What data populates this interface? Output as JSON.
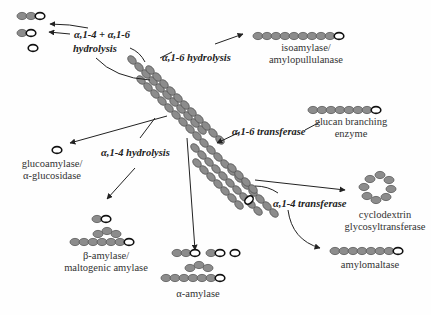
{
  "colors": {
    "glucose_fill": "#8c8c8c",
    "glucose_stroke": "#555555",
    "reducing_end_stroke": "#111111",
    "line": "#222222",
    "background": "#fefefe"
  },
  "reactions": {
    "a14_a16_hydrolysis_line1": "α,1-4 + α,1-6",
    "a14_a16_hydrolysis_line2": "hydrolysis",
    "a16_hydrolysis": "α,1-6 hydrolysis",
    "a16_transferase": "α,1-6 transferase",
    "a14_hydrolysis": "α,1-4 hydrolysis",
    "a14_transferase": "α,1-4 transferase"
  },
  "enzymes": {
    "isoamylase_line1": "isoamylase/",
    "isoamylase_line2": "amylopullulanase",
    "branching_line1": "glucan branching",
    "branching_line2": "enzyme",
    "glucoamylase_line1": "glucoamylase/",
    "glucoamylase_line2": "α-glucosidase",
    "cgtase_line1": "cyclodextrin",
    "cgtase_line2": "glycosyltransferase",
    "beta_amylase_line1": "β-amylase/",
    "beta_amylase_line2": "maltogenic amylase",
    "alpha_amylase": "α-amylase",
    "amylomaltase": "amylomaltase"
  },
  "legend": {
    "glucose_unit": "glucose-unit-icon",
    "reducing_end": "reducing-end-icon"
  }
}
